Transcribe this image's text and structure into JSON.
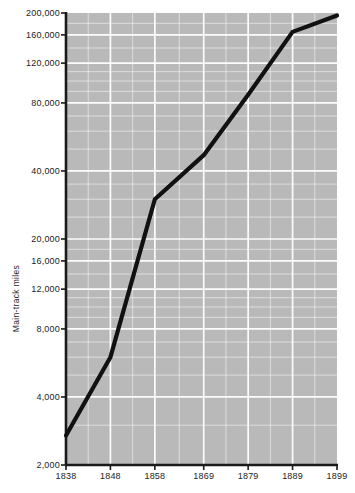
{
  "chart_data": {
    "type": "line",
    "title": "",
    "xlabel": "",
    "ylabel": "Main-track miles",
    "yscale": "log",
    "ylim": [
      2000,
      200000
    ],
    "xlim": [
      1838,
      1899
    ],
    "grid": true,
    "legend": null,
    "x": [
      1838,
      1848,
      1858,
      1869,
      1879,
      1889,
      1899
    ],
    "xtick_labels": [
      "1838",
      "1848",
      "1858",
      "1869",
      "1879",
      "1889",
      "1899"
    ],
    "ytick_values": [
      2000,
      4000,
      8000,
      12000,
      16000,
      20000,
      40000,
      80000,
      120000,
      160000,
      200000
    ],
    "ytick_labels": [
      "2,000",
      "4,000",
      "8,000",
      "12,000",
      "16,000",
      "20,000",
      "40,000",
      "80,000",
      "120,000",
      "160,000",
      "200,000"
    ],
    "series": [
      {
        "name": "Main-track miles",
        "color": "#111111",
        "values": [
          2700,
          6000,
          30000,
          47000,
          87000,
          165000,
          195000
        ]
      }
    ],
    "colors": {
      "plot_background": "#b9b9b9",
      "gridline": "#fcfcfc",
      "axis": "#1a1a1a",
      "line": "#111111",
      "tick_text": "#242424",
      "page_background": "#ffffff"
    },
    "minor_gridlines_y": [
      3000,
      5000,
      6000,
      7000,
      9000,
      10000,
      11000,
      14000,
      18000,
      25000,
      30000,
      35000,
      50000,
      60000,
      70000,
      90000,
      100000,
      110000,
      140000,
      180000
    ],
    "minor_gridlines_x": [
      1843,
      1853,
      1863.5,
      1874,
      1884,
      1894
    ]
  }
}
